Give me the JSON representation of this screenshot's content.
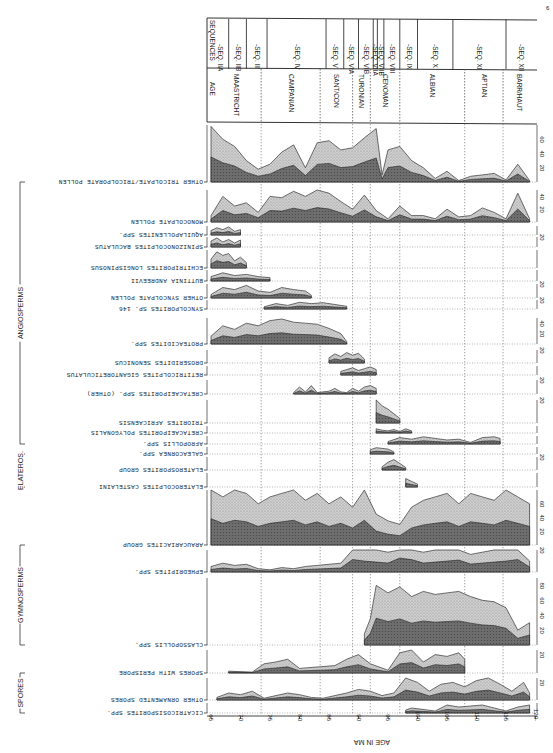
{
  "figure": {
    "corner_mark": "6",
    "x_axis_title": "AGE IN MA",
    "header": {
      "sequences_label": "SEQUENCES",
      "age_label": "AGE"
    }
  },
  "chart_data": {
    "type": "area",
    "xlabel": "AGE IN MA",
    "ylabel": "Relative abundance (%)",
    "xlim": [
      65,
      120
    ],
    "x_ticks": [
      65,
      70,
      75,
      80,
      85,
      90,
      95,
      100,
      105,
      110,
      115,
      120
    ],
    "grid": "vertical dotted lines at stage boundaries",
    "orientation": "rotated 180 degrees (labels printed upside-down)",
    "stages": [
      {
        "name": "MAASTRICHT",
        "from": 65,
        "to": 73.5
      },
      {
        "name": "CAMPANIAN",
        "from": 73.5,
        "to": 83.5
      },
      {
        "name": "SANT/CON",
        "from": 83.5,
        "to": 89
      },
      {
        "name": "TURONIAN",
        "from": 89,
        "to": 92
      },
      {
        "name": "CENOMAN",
        "from": 92,
        "to": 97
      },
      {
        "name": "ALBIAN",
        "from": 97,
        "to": 108
      },
      {
        "name": "APTIAN",
        "from": 108,
        "to": 114.5
      },
      {
        "name": "BARR/HAUT",
        "from": 114.5,
        "to": 120
      }
    ],
    "sequences": [
      {
        "name": "SEQ. IIA",
        "from": 65,
        "to": 68
      },
      {
        "name": "SEQ. IIB",
        "from": 68,
        "to": 71
      },
      {
        "name": "SEQ. III",
        "from": 71,
        "to": 74.5
      },
      {
        "name": "SEQ. IV",
        "from": 74.5,
        "to": 84.5
      },
      {
        "name": "SEQ. V",
        "from": 84.5,
        "to": 87.5
      },
      {
        "name": "SEQ. VIA",
        "from": 87.5,
        "to": 90
      },
      {
        "name": "SEQ. VIB",
        "from": 90,
        "to": 92.5
      },
      {
        "name": "SEQ. VIIA",
        "from": 92.5,
        "to": 93.2
      },
      {
        "name": "SEQ. VIIB",
        "from": 93.2,
        "to": 94.3
      },
      {
        "name": "SEQ. VIII",
        "from": 94.3,
        "to": 97
      },
      {
        "name": "SEQ. IX",
        "from": 97,
        "to": 100
      },
      {
        "name": "SEQ. X",
        "from": 100,
        "to": 106
      },
      {
        "name": "SEQ. XI",
        "from": 106,
        "to": 115
      },
      {
        "name": "SEQ. XII",
        "from": 115,
        "to": 120
      }
    ],
    "groups": [
      {
        "name": "ANGIOSPERMS",
        "taxa_from": 0,
        "taxa_to": 16
      },
      {
        "name": "ELATEROS.",
        "taxa_from": 15,
        "taxa_to": 17
      },
      {
        "name": "GYMNOSPERMS",
        "taxa_from": 18,
        "taxa_to": 20
      },
      {
        "name": "SPORES",
        "taxa_from": 21,
        "taxa_to": 23
      }
    ],
    "series": [
      {
        "name": "OTHER TRICOLPATE/TRICOLPORATE POLLEN",
        "scale_max": 80,
        "ticks": [
          20,
          40,
          60
        ],
        "range": [
          65,
          119
        ],
        "x": [
          65,
          67,
          69,
          71,
          73,
          75,
          77,
          79,
          81,
          83,
          85,
          87,
          89,
          91,
          93,
          94,
          95,
          97,
          99,
          101,
          103,
          105,
          107,
          109,
          111,
          113,
          115,
          117,
          119
        ],
        "values": [
          78,
          60,
          50,
          30,
          18,
          25,
          42,
          52,
          20,
          55,
          58,
          45,
          48,
          62,
          75,
          10,
          45,
          50,
          30,
          20,
          5,
          15,
          2,
          8,
          10,
          12,
          3,
          25,
          2
        ]
      },
      {
        "name": "MONOCOLPATE POLLEN",
        "scale_max": 50,
        "ticks": [
          20,
          40
        ],
        "range": [
          65,
          119
        ],
        "x": [
          65,
          67,
          69,
          71,
          73,
          75,
          77,
          79,
          81,
          83,
          85,
          87,
          89,
          91,
          93,
          95,
          97,
          99,
          101,
          103,
          105,
          107,
          109,
          111,
          113,
          115,
          117,
          119
        ],
        "values": [
          10,
          40,
          25,
          30,
          15,
          40,
          38,
          48,
          40,
          50,
          45,
          32,
          20,
          42,
          18,
          5,
          25,
          10,
          10,
          5,
          20,
          8,
          10,
          22,
          15,
          5,
          45,
          5
        ]
      },
      {
        "name": "AQUILAPOLLENITES SPP.",
        "scale_max": 10,
        "range": [
          65,
          70.5
        ],
        "x": [
          65,
          66,
          67,
          68,
          69,
          70
        ],
        "values": [
          5,
          8,
          6,
          9,
          4,
          6
        ]
      },
      {
        "name": "SPINIZONOCOLPITES BACULATUS",
        "scale_max": 20,
        "ticks": [
          20
        ],
        "range": [
          65,
          70.5
        ],
        "x": [
          65,
          66,
          67,
          68,
          69,
          70
        ],
        "values": [
          12,
          18,
          10,
          15,
          8,
          14
        ]
      },
      {
        "name": "ECHITRIPORITES LONGISPINOSUS",
        "scale_max": 20,
        "range": [
          65,
          72
        ],
        "x": [
          65,
          66,
          67,
          68,
          69,
          70,
          71
        ],
        "values": [
          10,
          18,
          14,
          16,
          8,
          12,
          6
        ]
      },
      {
        "name": "BUTTINIA ANDREEVII",
        "scale_max": 20,
        "range": [
          65,
          75
        ],
        "x": [
          65,
          67,
          69,
          71,
          73,
          75
        ],
        "values": [
          8,
          15,
          10,
          12,
          8,
          6
        ]
      },
      {
        "name": "OTHER SYNCOLPATE POLLEN",
        "scale_max": 20,
        "ticks": [
          20
        ],
        "range": [
          65,
          82.5
        ],
        "x": [
          65,
          67,
          69,
          71,
          73,
          75,
          77,
          79,
          81,
          82
        ],
        "values": [
          5,
          15,
          12,
          18,
          10,
          8,
          15,
          12,
          10,
          4
        ]
      },
      {
        "name": "SYNCOLPORITES SP. 146",
        "scale_max": 20,
        "ticks": [
          20
        ],
        "range": [
          74,
          89
        ],
        "x": [
          74,
          76,
          78,
          80,
          82,
          84,
          86,
          88
        ],
        "values": [
          5,
          12,
          8,
          15,
          12,
          14,
          10,
          6
        ]
      },
      {
        "name": "PROTEACIDITES SPP.",
        "scale_max": 50,
        "ticks": [
          20,
          40
        ],
        "range": [
          65,
          89
        ],
        "x": [
          65,
          67,
          69,
          71,
          73,
          75,
          77,
          79,
          81,
          83,
          85,
          87,
          88
        ],
        "values": [
          15,
          35,
          28,
          40,
          35,
          45,
          48,
          42,
          40,
          38,
          30,
          20,
          5
        ]
      },
      {
        "name": "DROSERIDITES SENONICUS",
        "scale_max": 20,
        "ticks": [
          20
        ],
        "range": [
          85,
          92
        ],
        "x": [
          85,
          86,
          87,
          88,
          89,
          90,
          91
        ],
        "values": [
          8,
          14,
          10,
          16,
          12,
          15,
          6
        ]
      },
      {
        "name": "RETITRICOLPITES GIGANTORETICULATUS",
        "scale_max": 10,
        "range": [
          86.5,
          94
        ],
        "x": [
          87,
          88,
          89,
          90,
          91,
          92,
          93
        ],
        "values": [
          4,
          6,
          8,
          5,
          7,
          9,
          6
        ]
      },
      {
        "name": "CRETACAEIPORITES SPP. (OTHER)",
        "scale_max": 20,
        "ticks": [
          20
        ],
        "range": [
          79,
          94
        ],
        "x": [
          79,
          80,
          81,
          82,
          83,
          85,
          86,
          87,
          88,
          89,
          90,
          91,
          92,
          93
        ],
        "values": [
          2,
          10,
          3,
          12,
          2,
          4,
          8,
          3,
          2,
          8,
          4,
          10,
          12,
          8
        ]
      },
      {
        "name": "TRIORITES AFRICAENSIS",
        "scale_max": 20,
        "ticks": [
          20
        ],
        "range": [
          93,
          97.5
        ],
        "x": [
          93,
          94,
          95,
          96,
          97
        ],
        "values": [
          20,
          15,
          12,
          8,
          4
        ]
      },
      {
        "name": "CRETACAEIPORITES POLYGONALIS",
        "scale_max": 10,
        "range": [
          93,
          99
        ],
        "x": [
          93,
          94,
          95,
          96,
          97,
          98,
          99
        ],
        "values": [
          6,
          4,
          3,
          5,
          2,
          6,
          3
        ]
      },
      {
        "name": "AFROPOLLIS SPP.",
        "scale_max": 10,
        "range": [
          95,
          115
        ],
        "x": [
          95,
          97,
          99,
          101,
          103,
          105,
          107,
          109,
          111,
          113,
          114
        ],
        "values": [
          3,
          8,
          6,
          9,
          7,
          5,
          6,
          2,
          8,
          9,
          7
        ]
      },
      {
        "name": "GALEACORNEA SPP.",
        "scale_max": 10,
        "range": [
          92,
          96.5
        ],
        "x": [
          92,
          93,
          94,
          95,
          96
        ],
        "values": [
          6,
          9,
          8,
          7,
          3
        ]
      },
      {
        "name": "ELATEROSPORITES GROUP",
        "scale_max": 20,
        "ticks": [
          20
        ],
        "range": [
          94,
          99
        ],
        "x": [
          94,
          95,
          96,
          97,
          98
        ],
        "values": [
          5,
          12,
          16,
          10,
          4
        ]
      },
      {
        "name": "ELATEROCOLPITES CASTELAINI",
        "scale_max": 10,
        "range": [
          97.5,
          100
        ],
        "x": [
          98,
          99,
          100
        ],
        "values": [
          6,
          4,
          2
        ]
      },
      {
        "name": "ARAUCARIACITES GROUP",
        "scale_max": 80,
        "ticks": [
          20,
          40,
          60
        ],
        "range": [
          65,
          120
        ],
        "x": [
          65,
          67,
          69,
          71,
          73,
          75,
          77,
          79,
          81,
          83,
          85,
          87,
          89,
          91,
          93,
          95,
          97,
          99,
          101,
          103,
          105,
          107,
          109,
          111,
          113,
          115,
          117,
          119
        ],
        "values": [
          85,
          70,
          80,
          75,
          60,
          70,
          75,
          80,
          65,
          75,
          60,
          70,
          55,
          80,
          45,
          35,
          30,
          55,
          65,
          70,
          75,
          60,
          75,
          70,
          65,
          80,
          70,
          60
        ]
      },
      {
        "name": "EPHEDRIPITES SPP.",
        "scale_max": 20,
        "ticks": [
          20
        ],
        "range": [
          65,
          119
        ],
        "x": [
          65,
          67,
          69,
          71,
          73,
          75,
          77,
          79,
          81,
          83,
          85,
          87,
          89,
          91,
          93,
          95,
          97,
          99,
          101,
          103,
          105,
          107,
          109,
          111,
          113,
          115,
          117,
          119
        ],
        "values": [
          5,
          8,
          6,
          7,
          3,
          2,
          4,
          3,
          5,
          6,
          7,
          8,
          25,
          22,
          20,
          18,
          28,
          25,
          18,
          20,
          22,
          24,
          16,
          18,
          20,
          22,
          25,
          10
        ]
      },
      {
        "name": "CLASSOPOLLIS SPP.",
        "scale_max": 90,
        "ticks": [
          20,
          40,
          60,
          80
        ],
        "range": [
          91,
          120
        ],
        "x": [
          91,
          92,
          93,
          95,
          97,
          99,
          101,
          103,
          105,
          107,
          109,
          111,
          113,
          115,
          117,
          119
        ],
        "values": [
          15,
          35,
          80,
          70,
          78,
          65,
          72,
          68,
          70,
          72,
          65,
          60,
          58,
          50,
          20,
          30
        ]
      },
      {
        "name": "SPORES WITH PERISPORE",
        "scale_max": 25,
        "ticks": [
          20
        ],
        "range": [
          68,
          109
        ],
        "x": [
          68,
          72,
          74,
          76,
          78,
          80,
          86,
          88,
          90,
          92,
          95,
          97,
          99,
          101,
          103,
          105,
          107,
          108
        ],
        "values": [
          2,
          1,
          10,
          12,
          15,
          5,
          8,
          15,
          20,
          10,
          3,
          22,
          25,
          12,
          20,
          18,
          22,
          15
        ]
      },
      {
        "name": "OTHER ORNAMENTED SPORES",
        "scale_max": 25,
        "ticks": [
          20
        ],
        "range": [
          66,
          119
        ],
        "x": [
          66,
          68,
          70,
          72,
          74,
          76,
          78,
          80,
          82,
          84,
          86,
          88,
          90,
          92,
          94,
          96,
          98,
          100,
          102,
          104,
          106,
          108,
          110,
          112,
          114,
          116,
          118,
          119
        ],
        "values": [
          3,
          8,
          6,
          10,
          2,
          5,
          8,
          6,
          3,
          2,
          5,
          8,
          12,
          10,
          5,
          8,
          25,
          20,
          10,
          18,
          20,
          15,
          22,
          25,
          18,
          10,
          20,
          8
        ]
      },
      {
        "name": "CICATRICOSISPORITES SPP.",
        "scale_max": 10,
        "range": [
          98,
          120
        ],
        "x": [
          98,
          99,
          103,
          105,
          107,
          109,
          111,
          113,
          115,
          117,
          119
        ],
        "values": [
          3,
          5,
          2,
          8,
          6,
          7,
          8,
          5,
          2,
          6,
          8
        ]
      }
    ]
  }
}
